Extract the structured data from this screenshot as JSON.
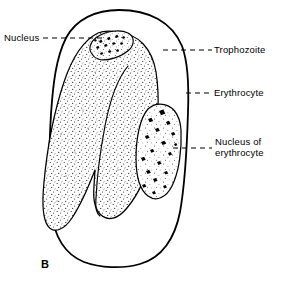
{
  "figure": {
    "letter": "B",
    "caption_letter_position": "bottom-left",
    "style": "black-and-white line drawing with stipple shading",
    "background_color": "#ffffff",
    "ink_color": "#000000"
  },
  "labels": [
    {
      "id": "nucleus",
      "text": "Nucleus",
      "side": "left",
      "lines": [
        "Nucleus"
      ],
      "leader": "dashed",
      "points_to": "trophozoite-nucleus"
    },
    {
      "id": "trophozoite",
      "text": "Trophozoite",
      "side": "right",
      "lines": [
        "Trophozoite"
      ],
      "leader": "dashed",
      "points_to": "trophozoite-body"
    },
    {
      "id": "erythrocyte",
      "text": "Erythrocyte",
      "side": "right",
      "lines": [
        "Erythrocyte"
      ],
      "leader": "dashed",
      "points_to": "erythrocyte-membrane"
    },
    {
      "id": "nucleus-of-erythrocyte",
      "text": "Nucleus of erythrocyte",
      "side": "right",
      "lines": [
        "Nucleus of",
        "erythrocyte"
      ],
      "leader": "dashed",
      "points_to": "erythrocyte-nucleus"
    }
  ],
  "structures": [
    {
      "id": "erythrocyte-membrane",
      "name": "Erythrocyte",
      "shape": "large rounded oval cell outline",
      "fill": "#ffffff",
      "stroke": "#000000"
    },
    {
      "id": "trophozoite-body",
      "name": "Trophozoite",
      "shape": "large amoeboid lobed body with internal fold",
      "fill": "#ffffff",
      "stipple": true,
      "stroke": "#000000"
    },
    {
      "id": "trophozoite-nucleus",
      "name": "Nucleus",
      "shape": "small tilted elongated oval with chromatin granules",
      "fill": "#ffffff",
      "stroke": "#000000"
    },
    {
      "id": "erythrocyte-nucleus",
      "name": "Nucleus of erythrocyte",
      "shape": "elongated oval with dark chromatin blobs",
      "fill": "#ffffff",
      "stroke": "#000000"
    }
  ]
}
